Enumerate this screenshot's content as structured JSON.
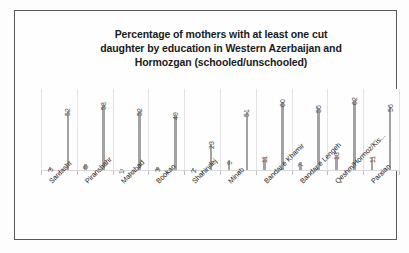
{
  "chart_data": {
    "type": "bar",
    "title": "Percentage of mothers with at least one cut daughter by education in Western Azerbaijan and Hormozgan (schooled/unschooled)",
    "title_lines": [
      "Percentage of mothers with at least one cut",
      "daughter by education in Western Azerbaijan and",
      "Hormozgan (schooled/unschooled)"
    ],
    "xlabel": "",
    "ylabel": "",
    "ylim": [
      0,
      70
    ],
    "grid": "vertical",
    "legend": "none",
    "categories": [
      "Sardasht",
      "Piranshahr",
      "Mahabad",
      "Bookan",
      "Shahindej",
      "Minab",
      "Bandar e Khamir",
      "Bandar e Lengeh",
      "Qeshm/Hormoz/Kis...",
      "Parsian"
    ],
    "series": [
      {
        "name": "schooled",
        "values": [
          3,
          5,
          1,
          3,
          2,
          9,
          11,
          7,
          13,
          11
        ]
      },
      {
        "name": "unschooled",
        "values": [
          52,
          58,
          52,
          49,
          23,
          51,
          60,
          55,
          62,
          56
        ]
      }
    ],
    "bars": [
      {
        "label": "3",
        "value": 3,
        "category": "Sardasht"
      },
      {
        "label": "52",
        "value": 52,
        "category": "Sardasht"
      },
      {
        "label": "5",
        "value": 5,
        "category": "Piranshahr"
      },
      {
        "label": "58",
        "value": 58,
        "category": "Piranshahr"
      },
      {
        "label": "1",
        "value": 1,
        "category": "Mahabad"
      },
      {
        "label": "52",
        "value": 52,
        "category": "Mahabad"
      },
      {
        "label": "3",
        "value": 3,
        "category": "Bookan"
      },
      {
        "label": "49",
        "value": 49,
        "category": "Bookan"
      },
      {
        "label": "2",
        "value": 2,
        "category": "Shahindej"
      },
      {
        "label": "23",
        "value": 23,
        "category": "Shahindej"
      },
      {
        "label": "9",
        "value": 9,
        "category": "Minab"
      },
      {
        "label": "51",
        "value": 51,
        "category": "Minab"
      },
      {
        "label": "11",
        "value": 11,
        "category": "Bandar e Khamir"
      },
      {
        "label": "60",
        "value": 60,
        "category": "Bandar e Khamir"
      },
      {
        "label": "7",
        "value": 7,
        "category": "Bandar e Lengeh"
      },
      {
        "label": "55",
        "value": 55,
        "category": "Bandar e Lengeh"
      },
      {
        "label": "13",
        "value": 13,
        "category": "Qeshm/Hormoz/Kis..."
      },
      {
        "label": "62",
        "value": 62,
        "category": "Qeshm/Hormoz/Kis..."
      },
      {
        "label": "11",
        "value": 11,
        "category": "Parsian"
      },
      {
        "label": "56",
        "value": 56,
        "category": "Parsian"
      }
    ],
    "bar_color": "#a2a2a2",
    "gridline_color": "#e2e2e2",
    "frame_color": "#585858",
    "background_color": "#fefefe"
  }
}
